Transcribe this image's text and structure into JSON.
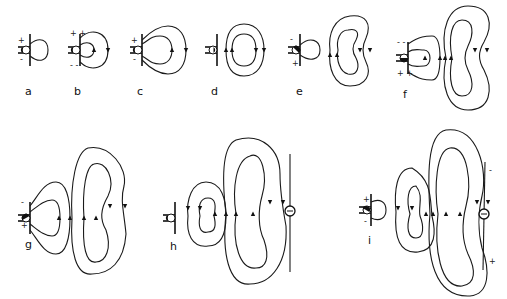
{
  "figure": {
    "panels": [
      {
        "id": "a",
        "label": "a",
        "top_charge": "+",
        "bottom_charge": "-"
      },
      {
        "id": "b",
        "label": "b",
        "top_charge": "+ +",
        "bottom_charge": "- -"
      },
      {
        "id": "c",
        "label": "c",
        "top_charge": "+",
        "bottom_charge": "-"
      },
      {
        "id": "d",
        "label": "d",
        "top_charge": "",
        "bottom_charge": ""
      },
      {
        "id": "e",
        "label": "e",
        "top_charge": "-",
        "bottom_charge": "+"
      },
      {
        "id": "f",
        "label": "f",
        "top_charge": "- -",
        "bottom_charge": "+ +"
      },
      {
        "id": "g",
        "label": "g",
        "top_charge": "-",
        "bottom_charge": "+"
      },
      {
        "id": "h",
        "label": "h",
        "top_charge": "",
        "bottom_charge": "",
        "receiver_symbol": "e"
      },
      {
        "id": "i",
        "label": "i",
        "top_charge": "+",
        "bottom_charge": "-",
        "receiver_top": "-",
        "receiver_bottom": "+"
      }
    ]
  }
}
